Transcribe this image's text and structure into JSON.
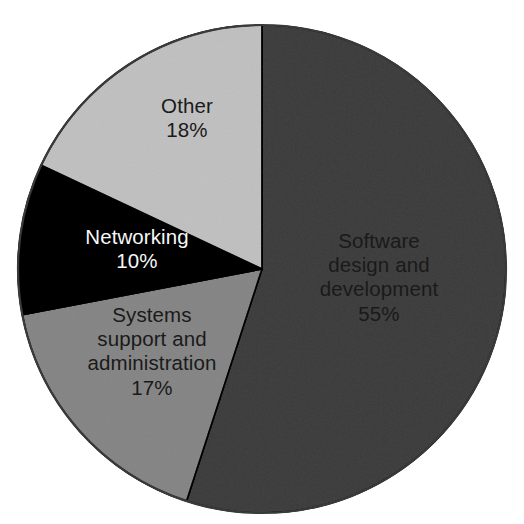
{
  "chart_data": {
    "type": "pie",
    "title": "",
    "subtitle": "",
    "xlabel": "",
    "ylabel": "",
    "legend_position": "none",
    "grid": false,
    "total": 100,
    "units": "%",
    "start_angle_deg": 0,
    "direction": "clockwise",
    "categories": [
      "Software design and development",
      "Systems support and administration",
      "Networking",
      "Other"
    ],
    "values": [
      55,
      17,
      10,
      18
    ],
    "slices": [
      {
        "label": "Software design and development",
        "label_lines": [
          "Software",
          "design and",
          "development"
        ],
        "value": 55,
        "value_text": "55%",
        "color": "#7f7f7f",
        "text_color": "#1a1a1a",
        "label_x": 379,
        "label_y": 277
      },
      {
        "label": "Systems support and administration",
        "label_lines": [
          "Systems",
          "support and",
          "administration"
        ],
        "value": 17,
        "value_text": "17%",
        "color": "#b9b9b9",
        "text_color": "#1a1a1a",
        "label_x": 152,
        "label_y": 351
      },
      {
        "label": "Networking",
        "label_lines": [
          "Networking"
        ],
        "value": 10,
        "value_text": "10%",
        "color": "#131313",
        "text_color": "#f7f7f7",
        "label_x": 137,
        "label_y": 249
      },
      {
        "label": "Other",
        "label_lines": [
          "Other"
        ],
        "value": 18,
        "value_text": "18%",
        "color": "#dedede",
        "text_color": "#1a1a1a",
        "label_x": 187,
        "label_y": 118
      }
    ],
    "geometry": {
      "center_x": 262,
      "center_y": 269,
      "radius": 244
    },
    "colors": {
      "background": "#ffffff",
      "outline": "#3a3a3a",
      "software": "#7f7f7f",
      "systems_support": "#b9b9b9",
      "networking": "#131313",
      "other": "#dedede"
    }
  }
}
